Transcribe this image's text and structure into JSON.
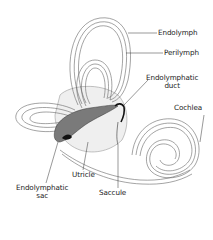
{
  "diagram": {
    "labels": [
      {
        "id": "endolymph",
        "text": "Endolymph"
      },
      {
        "id": "perilymph",
        "text": "Perilymph"
      },
      {
        "id": "endolymphatic_duct",
        "line1": "Endolymphatic",
        "line2": "duct"
      },
      {
        "id": "cochlea",
        "text": "Cochlea"
      },
      {
        "id": "utricle",
        "text": "Utricle"
      },
      {
        "id": "endolymphatic_sac",
        "line1": "Endolymphatic",
        "line2": "sac"
      },
      {
        "id": "saccule",
        "text": "Saccule"
      }
    ],
    "colors": {
      "line": "#555555",
      "fill_light": "#ececec",
      "sac_fill": "#7a7a7a",
      "duct_dark": "#111111"
    }
  }
}
